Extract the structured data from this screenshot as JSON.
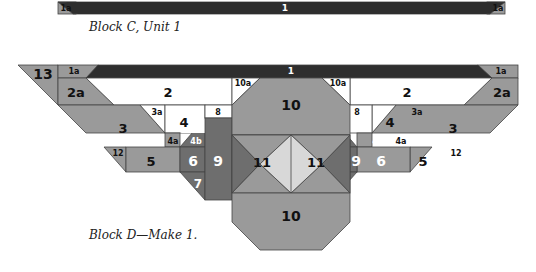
{
  "colors": {
    "dark": "#2e2e2e",
    "medium_dark": "#6e6e6e",
    "medium": "#9a9a9a",
    "light": "#d8d8d8",
    "white": "#ffffff",
    "outline": "#444444",
    "label_dark": "#111111",
    "label_light": "#ffffff"
  },
  "block_c": {
    "caption": "Block C, Unit 1",
    "pieces": {
      "p1": "1",
      "p1a_left": "1a",
      "p1a_right": "1a"
    }
  },
  "block_d": {
    "caption": "Block D—Make 1.",
    "pieces": {
      "p13": "13",
      "p1": "1",
      "p1a_left": "1a",
      "p1a_right": "1a",
      "p2_left": "2",
      "p2_right": "2",
      "p2a_left": "2a",
      "p2a_right": "2a",
      "p3_left": "3",
      "p3_right": "3",
      "p3a_left": "3a",
      "p3a_right": "3a",
      "p4_left": "4",
      "p4_right": "4",
      "p4a_left": "4a",
      "p4a_right": "4a",
      "p4b_left": "4b",
      "p4b_right": "4b",
      "p5_left": "5",
      "p5_right": "5",
      "p6_left": "6",
      "p6_right": "6",
      "p7_left": "7",
      "p7_right": "7",
      "p8_left": "8",
      "p8_right": "8",
      "p9_left": "9",
      "p9_right": "9",
      "p10_top": "10",
      "p10_bottom": "10",
      "p10a_left": "10a",
      "p10a_right": "10a",
      "p11_left": "11",
      "p11_right": "11",
      "p12_left": "12",
      "p12_right": "12"
    }
  }
}
